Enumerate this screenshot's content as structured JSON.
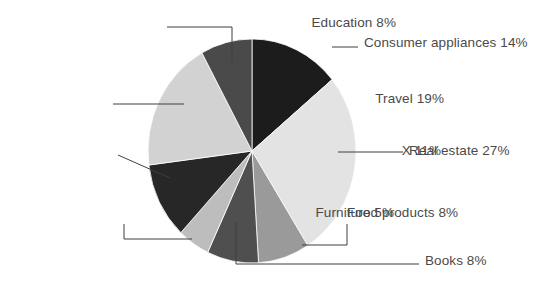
{
  "chart_data": {
    "type": "pie",
    "title": "",
    "subtitle": "",
    "xlabel": "",
    "ylabel": "",
    "units": "percent",
    "total": 100,
    "legend_position": "none",
    "label_style": "callout-with-leader-lines",
    "start_angle_deg": 0,
    "direction": "clockwise",
    "categories": [
      "Consumer appliances",
      "Real estate",
      "Food products",
      "Books",
      "Furniture",
      "X",
      "Travel",
      "Education"
    ],
    "values": [
      14,
      27,
      8,
      8,
      5,
      11,
      19,
      8
    ],
    "slices": [
      {
        "name": "consumer-appliances",
        "label": "Consumer appliances 14%",
        "category": "Consumer appliances",
        "value": 14,
        "value_text": "14%",
        "color": "#1c1c1c",
        "label_side": "right",
        "label_left": 364,
        "label_top": 36,
        "leader": {
          "type": "line",
          "x1": 332,
          "y1": 47,
          "x2": 358,
          "y2": 47
        }
      },
      {
        "name": "real-estate",
        "label": "Real estate 27%",
        "category": "Real estate",
        "value": 27,
        "value_text": "27%",
        "color": "#e3e3e3",
        "label_side": "right",
        "label_left": 409,
        "label_top": 144,
        "leader": {
          "type": "line",
          "x1": 338,
          "y1": 152,
          "x2": 403,
          "y2": 152
        }
      },
      {
        "name": "food-products",
        "label": "Food products 8%",
        "category": "Food products",
        "value": 8,
        "value_text": "8%",
        "color": "#9a9a9a",
        "label_side": "right",
        "label_left": 347,
        "label_top": 206,
        "leader": {
          "type": "elbow",
          "x1": 302,
          "y1": 245,
          "x2": 347,
          "y2": 245,
          "x3": 347,
          "y3": 224
        }
      },
      {
        "name": "books",
        "label": "Books 8%",
        "category": "Books",
        "value": 8,
        "value_text": "8%",
        "color": "#4f4f4f",
        "label_side": "right",
        "label_left": 425,
        "label_top": 254,
        "leader": {
          "type": "elbow",
          "x1": 236,
          "y1": 222,
          "x2": 236,
          "y2": 264,
          "x3": 419,
          "y3": 264
        }
      },
      {
        "name": "furniture",
        "label": "Furniture 5%",
        "category": "Furniture",
        "value": 5,
        "value_text": "5%",
        "color": "#bdbdbd",
        "label_side": "left",
        "label_top": 206,
        "label_right": 394,
        "leader": {
          "type": "elbow",
          "x1": 192,
          "y1": 239,
          "x2": 124,
          "y2": 239,
          "x3": 124,
          "y3": 224
        }
      },
      {
        "name": "x",
        "label": "X 11%",
        "category": "X",
        "value": 11,
        "value_text": "11%",
        "color": "#272727",
        "label_side": "left",
        "label_top": 144,
        "label_right": 441,
        "leader": {
          "type": "line",
          "x1": 170,
          "y1": 178,
          "x2": 118,
          "y2": 155
        }
      },
      {
        "name": "travel",
        "label": "Travel 19%",
        "category": "Travel",
        "value": 19,
        "value_text": "19%",
        "color": "#d2d2d2",
        "label_side": "left",
        "label_top": 92,
        "label_right": 444,
        "leader": {
          "type": "line",
          "x1": 113,
          "y1": 104,
          "x2": 184,
          "y2": 104
        }
      },
      {
        "name": "education",
        "label": "Education 8%",
        "category": "Education",
        "value": 8,
        "value_text": "8%",
        "color": "#4a4a4a",
        "label_side": "left",
        "label_top": 16,
        "label_right": 396,
        "leader": {
          "type": "elbow",
          "x1": 167,
          "y1": 27,
          "x2": 232,
          "y2": 27,
          "x3": 232,
          "y3": 62
        }
      }
    ],
    "geometry": {
      "center_x": 252,
      "center_y": 151,
      "radius_x": 104,
      "radius_y": 112
    },
    "colors": {
      "background": "#ffffff",
      "text": "#4a4a4a",
      "leader_line": "#3f3f3f"
    }
  }
}
